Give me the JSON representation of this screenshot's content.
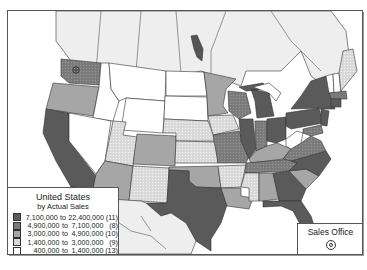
{
  "map": {
    "title": "United States",
    "subtitle": "by Actual Sales",
    "colors": {
      "class1": "#5a5a5a",
      "class2": "#7a7a7a",
      "class3": "#a6a6a6",
      "class4": "#cfcfcf",
      "class5": "#ffffff",
      "canada": "#eeeeee",
      "mexico": "#eeeeee",
      "water": "#ffffff",
      "border": "#333333"
    },
    "legend": {
      "items": [
        {
          "low": "7,100,000",
          "to": "to",
          "high": "22,400,000",
          "count": "(11)",
          "color": "#5a5a5a"
        },
        {
          "low": "4,900,000",
          "to": "to",
          "high": "7,100,000",
          "count": "(8)",
          "color": "#7a7a7a"
        },
        {
          "low": "3,000,000",
          "to": "to",
          "high": "4,900,000",
          "count": "(10)",
          "color": "#a6a6a6"
        },
        {
          "low": "1,400,000",
          "to": "to",
          "high": "3,000,000",
          "count": "(9)",
          "color": "#d6d6d6"
        },
        {
          "low": "400,000",
          "to": "to",
          "high": "1,400,000",
          "count": "(13)",
          "color": "#ffffff"
        }
      ]
    },
    "sales_office": {
      "label": "Sales Office",
      "symbol": "bullseye-icon"
    }
  }
}
